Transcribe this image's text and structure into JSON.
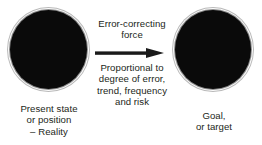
{
  "diagram": {
    "background_color": "#ffffff",
    "text_color": "#231f20",
    "node_fill_color": "#0a0a0a",
    "node_ring_color": "#8e8e8e",
    "arrow_color": "#1a1a1a",
    "nodes": [
      {
        "id": "present-state",
        "shape": "filled-circle",
        "caption": "Present state\nor position\n– Reality"
      },
      {
        "id": "goal",
        "shape": "filled-circle",
        "caption": "Goal,\nor target"
      }
    ],
    "connector": {
      "id": "error-correcting-force",
      "type": "arrow",
      "direction": "left-to-right",
      "label_above": "Error-correcting\nforce",
      "label_below": "Proportional to\ndegree of error,\ntrend, frequency\nand risk"
    }
  }
}
